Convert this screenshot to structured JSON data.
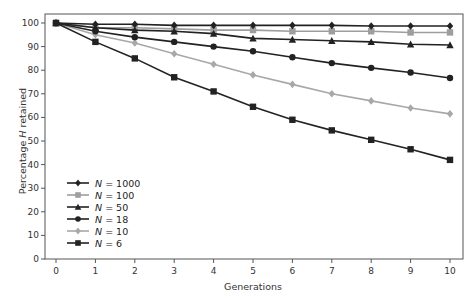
{
  "chart_data": {
    "type": "line",
    "title": "",
    "xlabel": "Generations",
    "ylabel_prefix": "Percentage ",
    "ylabel_italic": "H",
    "ylabel_suffix": " retained",
    "ylabel": "Percentage H retained",
    "x": [
      0,
      1,
      2,
      3,
      4,
      5,
      6,
      7,
      8,
      9,
      10
    ],
    "xlim": [
      0,
      10
    ],
    "ylim": [
      0,
      100
    ],
    "xticks": [
      0,
      1,
      2,
      3,
      4,
      5,
      6,
      7,
      8,
      9,
      10
    ],
    "yticks": [
      0,
      10,
      20,
      30,
      40,
      50,
      60,
      70,
      80,
      90,
      100
    ],
    "grid": false,
    "legend_position": "lower left",
    "series": [
      {
        "name": "N = 1000",
        "var": "N",
        "value": "1000",
        "color": "#222222",
        "marker": "diamond",
        "values": [
          100,
          99.5,
          99.5,
          99,
          99,
          99,
          99,
          99,
          98.7,
          98.7,
          98.7
        ]
      },
      {
        "name": "N = 100",
        "var": "N",
        "value": "100",
        "color": "#9e9e9e",
        "marker": "square",
        "values": [
          100,
          98,
          98,
          97.5,
          97,
          97,
          96.5,
          96.5,
          96.5,
          96,
          96
        ]
      },
      {
        "name": "N = 50",
        "var": "N",
        "value": "50",
        "color": "#222222",
        "marker": "triangle",
        "values": [
          100,
          98,
          97,
          96.5,
          95.5,
          93.5,
          93,
          92.5,
          92,
          91,
          90.7
        ]
      },
      {
        "name": "N = 18",
        "var": "N",
        "value": "18",
        "color": "#222222",
        "marker": "circle",
        "values": [
          100,
          96.5,
          94,
          92,
          90,
          88,
          85.5,
          83,
          81,
          79,
          76.7
        ]
      },
      {
        "name": "N = 10",
        "var": "N",
        "value": "10",
        "color": "#a8a8a8",
        "marker": "diamond",
        "values": [
          100,
          95,
          91.5,
          87,
          82.5,
          78,
          74,
          70,
          67,
          64,
          61.5
        ]
      },
      {
        "name": "N = 6",
        "var": "N",
        "value": "6",
        "color": "#222222",
        "marker": "square",
        "values": [
          100,
          92,
          85,
          77,
          71,
          64.5,
          59,
          54.5,
          50.5,
          46.5,
          42
        ]
      }
    ]
  }
}
